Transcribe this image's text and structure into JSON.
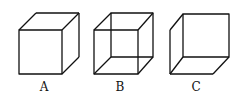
{
  "figure": {
    "cubes": [
      {
        "label": "A",
        "description": "solid cube viewed from above-right, hidden edges removed"
      },
      {
        "label": "B",
        "description": "wireframe cube with all edges visible"
      },
      {
        "label": "C",
        "description": "cube viewed from below-left, hidden edges removed"
      }
    ],
    "stroke_color": "#111111"
  }
}
